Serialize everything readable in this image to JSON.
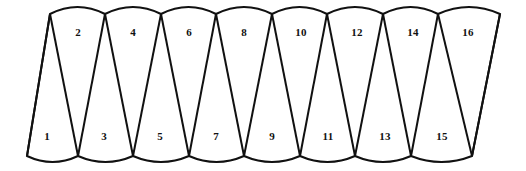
{
  "figure": {
    "type": "triangulated-strip-diagram",
    "stroke_color": "#111111",
    "fill_color": "#ffffff",
    "background_color": "#ffffff",
    "stroke_width": 2,
    "triangle_count": 16,
    "top_vertex_count": 8,
    "bottom_vertex_count": 9
  },
  "geometry": {
    "width": 526,
    "height": 171,
    "top_y": 14,
    "bottom_y": 156,
    "top_arc_sag": 7,
    "bottom_arc_sag": 6,
    "top_vertices_x": [
      50,
      105,
      161,
      216,
      272,
      327,
      383,
      438,
      500
    ],
    "bottom_vertices_x": [
      27,
      78,
      133,
      189,
      244,
      300,
      355,
      411,
      472
    ]
  },
  "labels": [
    {
      "text": "1",
      "x": 47,
      "y": 136,
      "row": "bottom"
    },
    {
      "text": "2",
      "x": 78,
      "y": 32,
      "row": "top"
    },
    {
      "text": "3",
      "x": 104,
      "y": 136,
      "row": "bottom"
    },
    {
      "text": "4",
      "x": 133,
      "y": 32,
      "row": "top"
    },
    {
      "text": "5",
      "x": 160,
      "y": 136,
      "row": "bottom"
    },
    {
      "text": "6",
      "x": 189,
      "y": 32,
      "row": "top"
    },
    {
      "text": "7",
      "x": 216,
      "y": 136,
      "row": "bottom"
    },
    {
      "text": "8",
      "x": 244,
      "y": 32,
      "row": "top"
    },
    {
      "text": "9",
      "x": 272,
      "y": 136,
      "row": "bottom"
    },
    {
      "text": "10",
      "x": 301,
      "y": 32,
      "row": "top"
    },
    {
      "text": "11",
      "x": 328,
      "y": 136,
      "row": "bottom"
    },
    {
      "text": "12",
      "x": 357,
      "y": 32,
      "row": "top"
    },
    {
      "text": "13",
      "x": 385,
      "y": 136,
      "row": "bottom"
    },
    {
      "text": "14",
      "x": 413,
      "y": 32,
      "row": "top"
    },
    {
      "text": "15",
      "x": 442,
      "y": 136,
      "row": "bottom"
    },
    {
      "text": "16",
      "x": 468,
      "y": 32,
      "row": "top"
    }
  ]
}
